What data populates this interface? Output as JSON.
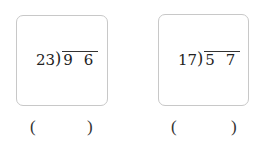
{
  "problems": [
    {
      "divisor": "23",
      "dividend": "9 6",
      "answer_open": "(",
      "answer_close": ")"
    },
    {
      "divisor": "17",
      "dividend": "5 7",
      "answer_open": "(",
      "answer_close": ")"
    }
  ],
  "symbols": {
    "division_bracket": ")"
  }
}
